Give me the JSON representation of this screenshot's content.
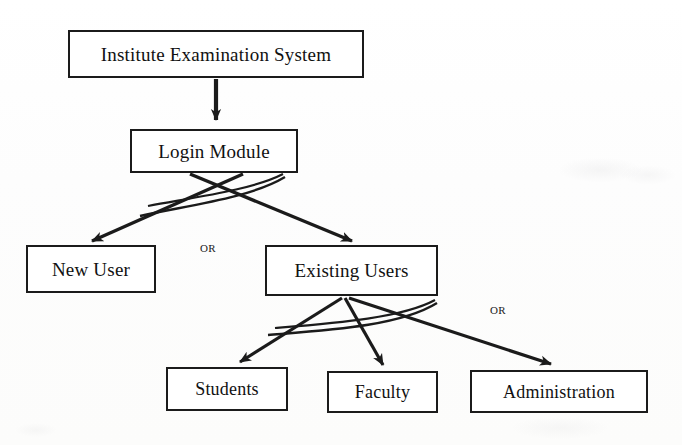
{
  "diagram": {
    "type": "flowchart",
    "background_color": "#fdfdfc",
    "line_color": "#1b1b1b",
    "nodes": [
      {
        "id": "institute-examination-system",
        "label": "Institute Examination System",
        "x": 68,
        "y": 30,
        "w": 296,
        "h": 48,
        "font_size": 19
      },
      {
        "id": "login-module",
        "label": "Login Module",
        "x": 130,
        "y": 129,
        "w": 168,
        "h": 44,
        "font_size": 19
      },
      {
        "id": "new-user",
        "label": "New User",
        "x": 26,
        "y": 245,
        "w": 130,
        "h": 48,
        "font_size": 19
      },
      {
        "id": "existing-users",
        "label": "Existing Users",
        "x": 265,
        "y": 245,
        "w": 173,
        "h": 51,
        "font_size": 19
      },
      {
        "id": "students",
        "label": "Students",
        "x": 166,
        "y": 367,
        "w": 122,
        "h": 44,
        "font_size": 18
      },
      {
        "id": "faculty",
        "label": "Faculty",
        "x": 327,
        "y": 371,
        "w": 111,
        "h": 42,
        "font_size": 18
      },
      {
        "id": "administration",
        "label": "Administration",
        "x": 470,
        "y": 370,
        "w": 178,
        "h": 43,
        "font_size": 18
      }
    ],
    "or_labels": [
      {
        "id": "or-login-branch",
        "text": "OR",
        "x": 200,
        "y": 243
      },
      {
        "id": "or-users-branch",
        "text": "OR",
        "x": 490,
        "y": 305
      }
    ],
    "edges": [
      {
        "id": "edge-system-to-login",
        "from": "institute-examination-system",
        "to": "login-module",
        "kind": "arrow"
      },
      {
        "id": "edge-login-to-new-user",
        "from": "login-module",
        "to": "new-user",
        "kind": "arrow"
      },
      {
        "id": "edge-login-to-existing-users",
        "from": "login-module",
        "to": "existing-users",
        "kind": "arrow"
      },
      {
        "id": "edge-existing-to-students",
        "from": "existing-users",
        "to": "students",
        "kind": "arrow"
      },
      {
        "id": "edge-existing-to-faculty",
        "from": "existing-users",
        "to": "faculty",
        "kind": "arrow"
      },
      {
        "id": "edge-existing-to-administration",
        "from": "existing-users",
        "to": "administration",
        "kind": "arrow"
      },
      {
        "id": "arc-login-or",
        "from": "login-module",
        "to": "login-module",
        "kind": "or-arc"
      },
      {
        "id": "arc-existing-or",
        "from": "existing-users",
        "to": "existing-users",
        "kind": "or-arc"
      }
    ]
  }
}
